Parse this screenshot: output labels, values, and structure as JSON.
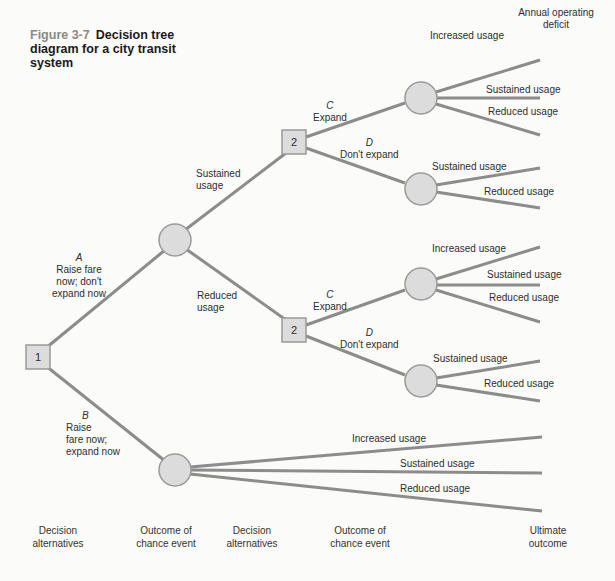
{
  "figure": {
    "number": "Figure 3-7",
    "title": "Decision tree diagram for a city transit system"
  },
  "colors": {
    "line": "#8c8c8c",
    "node_fill": "#dcdcdc",
    "node_stroke": "#9a9a9a",
    "caption_number": "#8a8a8a"
  },
  "nodes": {
    "decision_1": {
      "label": "1",
      "type": "decision"
    },
    "chance_A": {
      "type": "chance"
    },
    "decision_2_top": {
      "label": "2",
      "type": "decision"
    },
    "decision_2_bottom": {
      "label": "2",
      "type": "decision"
    },
    "chance_B": {
      "type": "chance"
    },
    "chance_top_C": {
      "type": "chance"
    },
    "chance_top_D": {
      "type": "chance"
    },
    "chance_bottom_C": {
      "type": "chance"
    },
    "chance_bottom_D": {
      "type": "chance"
    }
  },
  "branches": {
    "A": {
      "letter": "A",
      "line1": "Raise fare",
      "line2": "now; don't",
      "line3": "expand now"
    },
    "B": {
      "letter": "B",
      "line1": "Raise",
      "line2": "fare now;",
      "line3": "expand now"
    },
    "sustained": {
      "line1": "Sustained",
      "line2": "usage"
    },
    "reduced": {
      "line1": "Reduced",
      "line2": "usage"
    },
    "top_C": {
      "letter": "C",
      "label": "Expand"
    },
    "top_D": {
      "letter": "D",
      "label": "Don't expand"
    },
    "bottom_C": {
      "letter": "C",
      "label": "Expand"
    },
    "bottom_D": {
      "letter": "D",
      "label": "Don't expand"
    }
  },
  "outcomes": {
    "header_line1": "Annual operating",
    "header_line2": "deficit",
    "top_C": [
      "Increased usage",
      "Sustained usage",
      "Reduced usage"
    ],
    "top_D": [
      "Sustained usage",
      "Reduced usage"
    ],
    "bottom_C": [
      "Increased usage",
      "Sustained usage",
      "Reduced usage"
    ],
    "bottom_D": [
      "Sustained usage",
      "Reduced usage"
    ],
    "B": [
      "Increased usage",
      "Sustained usage",
      "Reduced usage"
    ]
  },
  "columns": [
    {
      "line1": "Decision",
      "line2": "alternatives"
    },
    {
      "line1": "Outcome of",
      "line2": "chance event"
    },
    {
      "line1": "Decision",
      "line2": "alternatives"
    },
    {
      "line1": "Outcome of",
      "line2": "chance event"
    },
    {
      "line1": "Ultimate",
      "line2": "outcome"
    }
  ]
}
